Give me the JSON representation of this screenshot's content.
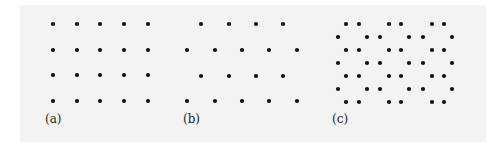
{
  "figure": {
    "background_color": "#f3f3f3",
    "dot_color": "#111111",
    "dot_radius": 2.1,
    "panels": [
      {
        "id": "a",
        "label": "(a)",
        "label_pos": [
          45,
          113
        ],
        "description": "square lattice, 5 columns x 4 rows",
        "dots": [
          [
            53,
            24
          ],
          [
            77,
            24
          ],
          [
            100,
            24
          ],
          [
            124,
            24
          ],
          [
            148,
            24
          ],
          [
            53,
            50
          ],
          [
            77,
            50
          ],
          [
            100,
            50
          ],
          [
            124,
            50
          ],
          [
            148,
            50
          ],
          [
            53,
            75
          ],
          [
            77,
            75
          ],
          [
            100,
            75
          ],
          [
            124,
            75
          ],
          [
            148,
            75
          ],
          [
            53,
            101
          ],
          [
            77,
            101
          ],
          [
            100,
            101
          ],
          [
            124,
            101
          ],
          [
            148,
            101
          ]
        ]
      },
      {
        "id": "b",
        "label": "(b)",
        "label_pos": [
          183,
          113
        ],
        "description": "triangular (hexagonal) lattice, alternating rows of 4 and 5",
        "dots": [
          [
            201,
            24
          ],
          [
            229,
            24
          ],
          [
            256,
            24
          ],
          [
            283,
            24
          ],
          [
            187,
            50
          ],
          [
            215,
            50
          ],
          [
            242,
            50
          ],
          [
            269,
            50
          ],
          [
            297,
            50
          ],
          [
            201,
            76
          ],
          [
            229,
            76
          ],
          [
            256,
            76
          ],
          [
            283,
            76
          ],
          [
            187,
            101
          ],
          [
            215,
            101
          ],
          [
            242,
            101
          ],
          [
            269,
            101
          ],
          [
            297,
            101
          ]
        ]
      },
      {
        "id": "c",
        "label": "(c)",
        "label_pos": [
          332,
          113
        ],
        "description": "honeycomb lattice",
        "dots": [
          [
            346,
            24
          ],
          [
            359,
            24
          ],
          [
            389,
            24
          ],
          [
            401,
            24
          ],
          [
            432,
            24
          ],
          [
            444,
            24
          ],
          [
            338,
            37
          ],
          [
            367,
            37
          ],
          [
            380,
            37
          ],
          [
            409,
            37
          ],
          [
            423,
            37
          ],
          [
            452,
            37
          ],
          [
            346,
            50
          ],
          [
            359,
            50
          ],
          [
            389,
            50
          ],
          [
            401,
            50
          ],
          [
            432,
            50
          ],
          [
            444,
            50
          ],
          [
            338,
            63
          ],
          [
            367,
            63
          ],
          [
            380,
            63
          ],
          [
            409,
            63
          ],
          [
            423,
            63
          ],
          [
            452,
            63
          ],
          [
            346,
            76
          ],
          [
            359,
            76
          ],
          [
            389,
            76
          ],
          [
            401,
            76
          ],
          [
            432,
            76
          ],
          [
            444,
            76
          ],
          [
            338,
            89
          ],
          [
            367,
            89
          ],
          [
            380,
            89
          ],
          [
            409,
            89
          ],
          [
            423,
            89
          ],
          [
            452,
            89
          ],
          [
            346,
            102
          ],
          [
            359,
            102
          ],
          [
            389,
            102
          ],
          [
            401,
            102
          ],
          [
            432,
            102
          ],
          [
            444,
            102
          ]
        ]
      }
    ]
  }
}
